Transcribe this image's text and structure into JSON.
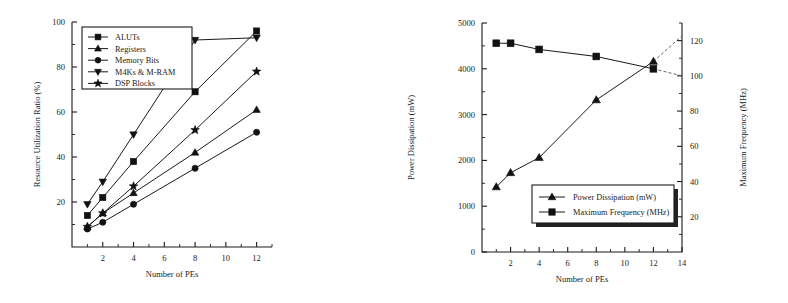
{
  "figure": {
    "background": "#ffffff",
    "ink": "#1a1a1a",
    "panels": [
      "resource-utilization-chart",
      "power-frequency-chart"
    ]
  },
  "chart_data": [
    {
      "type": "line",
      "id": "resource-utilization-chart",
      "title": "",
      "xlabel": "Number of PEs",
      "ylabel": "Resource Utilization Ratio (%)",
      "x": [
        1,
        2,
        4,
        8,
        12
      ],
      "xlim": [
        0,
        13
      ],
      "ylim": [
        0,
        100
      ],
      "xticks": [
        2,
        4,
        6,
        8,
        10,
        12
      ],
      "yticks": [
        20,
        40,
        60,
        80,
        100
      ],
      "xticklabels": [
        "2",
        "4",
        "6",
        "8",
        "10",
        "12"
      ],
      "yticklabels": [
        "20",
        "40",
        "60",
        "80",
        "100"
      ],
      "grid": false,
      "legend_position": "upper-left",
      "series": [
        {
          "name": "ALUTs",
          "marker": "square",
          "values": [
            14,
            22,
            38,
            69,
            96
          ]
        },
        {
          "name": "Registers",
          "marker": "triangle-up",
          "values": [
            9,
            15,
            24,
            42,
            61
          ]
        },
        {
          "name": "Memory Bits",
          "marker": "circle",
          "values": [
            8,
            11,
            19,
            35,
            51
          ]
        },
        {
          "name": "M4Ks & M-RAM",
          "marker": "triangle-down",
          "values": [
            19,
            29,
            50,
            92,
            93
          ]
        },
        {
          "name": "DSP Blocks",
          "marker": "star",
          "values": [
            9,
            15,
            27,
            52,
            78
          ]
        }
      ]
    },
    {
      "type": "line",
      "id": "power-frequency-chart",
      "title": "",
      "xlabel": "Number of PEs",
      "ylabel": "Power Dissipation (mW)",
      "ylabel_right": "Maximum Frequency (MHz)",
      "x": [
        1,
        2,
        4,
        8,
        12
      ],
      "xlim": [
        0,
        14
      ],
      "ylim": [
        0,
        5000
      ],
      "ylim_right": [
        0,
        130
      ],
      "xticks": [
        2,
        4,
        6,
        8,
        10,
        12,
        14
      ],
      "yticks": [
        0,
        1000,
        2000,
        3000,
        4000,
        5000
      ],
      "yticks_right": [
        20,
        40,
        60,
        80,
        100,
        120
      ],
      "xticklabels": [
        "2",
        "4",
        "6",
        "8",
        "10",
        "12",
        "14"
      ],
      "yticklabels": [
        "0",
        "1000",
        "2000",
        "3000",
        "4000",
        "5000"
      ],
      "yticklabels_right": [
        "20",
        "40",
        "60",
        "80",
        "100",
        "120"
      ],
      "grid": false,
      "legend_position": "lower-center",
      "series": [
        {
          "name": "Power Dissipation (mW)",
          "marker": "triangle-up",
          "axis": "left",
          "values": [
            1420,
            1730,
            2060,
            3320,
            4160
          ],
          "extrapolated_to": {
            "x": 14,
            "y": 4720
          }
        },
        {
          "name": "Maximum Frequency (MHz)",
          "marker": "square",
          "axis": "right",
          "values": [
            118.5,
            118.5,
            115,
            111,
            104
          ],
          "extrapolated_to": {
            "x": 14,
            "y": 100
          }
        }
      ]
    }
  ],
  "left_chart": {
    "ylabel": "Resource Utilization Ratio (%)",
    "xlabel": "Number of PEs",
    "legend": [
      {
        "label": "ALUTs"
      },
      {
        "label": "Registers"
      },
      {
        "label": "Memory Bits"
      },
      {
        "label": "M4Ks & M-RAM"
      },
      {
        "label": "DSP Blocks"
      }
    ],
    "yticklabels": [
      "20",
      "40",
      "60",
      "80",
      "100"
    ],
    "xticklabels": [
      "2",
      "4",
      "6",
      "8",
      "10",
      "12"
    ]
  },
  "right_chart": {
    "ylabel": "Power Dissipation (mW)",
    "ylabel_right": "Maximum Frequency (MHz)",
    "xlabel": "Number of PEs",
    "legend": [
      {
        "label": "Power Dissipation (mW)"
      },
      {
        "label": "Maximum Frequency (MHz)"
      }
    ],
    "yticklabels": [
      "0",
      "1000",
      "2000",
      "3000",
      "4000",
      "5000"
    ],
    "yticklabels_right": [
      "20",
      "40",
      "60",
      "80",
      "100",
      "120"
    ],
    "xticklabels": [
      "2",
      "4",
      "6",
      "8",
      "10",
      "12",
      "14"
    ]
  }
}
